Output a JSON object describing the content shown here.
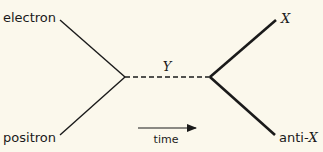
{
  "diagram": {
    "type": "feynman-diagram",
    "background": "#fbf8ec",
    "line_color": "#1a1a1a",
    "incoming": [
      {
        "label": "electron",
        "role": "incoming-particle"
      },
      {
        "label": "positron",
        "role": "incoming-particle"
      }
    ],
    "propagator": {
      "label": "Y",
      "style": "dashed"
    },
    "outgoing": [
      {
        "label": "X",
        "role": "outgoing-particle"
      },
      {
        "label_prefix": "anti-",
        "label_symbol": "X",
        "role": "outgoing-antiparticle"
      }
    ],
    "time_axis": {
      "label": "time",
      "direction": "left-to-right"
    }
  }
}
